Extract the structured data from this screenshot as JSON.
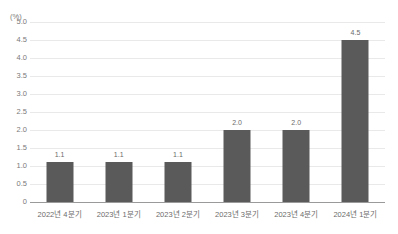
{
  "chart_data": {
    "type": "bar",
    "title": "",
    "xlabel": "",
    "ylabel": "(%)",
    "unit_label": "(%)",
    "categories": [
      "2022년 4분기",
      "2023년 1분기",
      "2023년 2분기",
      "2023년 3분기",
      "2023년 4분기",
      "2024년 1분기"
    ],
    "values": [
      1.1,
      1.1,
      1.1,
      2.0,
      2.0,
      4.5
    ],
    "value_labels": [
      "1.1",
      "1.1",
      "1.1",
      "2.0",
      "2.0",
      "4.5"
    ],
    "ylim": [
      0,
      5.0
    ],
    "yticks": [
      0,
      0.5,
      1.0,
      1.5,
      2.0,
      2.5,
      3.0,
      3.5,
      4.0,
      4.5,
      5.0
    ],
    "ytick_labels": [
      "0",
      "0.5",
      "1.0",
      "1.5",
      "2.0",
      "2.5",
      "3.0",
      "3.5",
      "4.0",
      "4.5",
      "5.0"
    ],
    "grid": true,
    "legend": null,
    "bar_color": "#5a5a5a",
    "grid_color": "#e9e9e9",
    "axis_color": "#9a9a9a",
    "background_color": "#ffffff"
  }
}
